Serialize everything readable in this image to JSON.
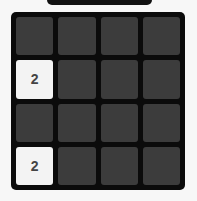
{
  "board": {
    "rows": 4,
    "cols": 4,
    "tiles": [
      [
        "",
        "",
        "",
        ""
      ],
      [
        "2",
        "",
        "",
        ""
      ],
      [
        "",
        "",
        "",
        ""
      ],
      [
        "2",
        "",
        "",
        ""
      ]
    ]
  },
  "colors": {
    "board": "#0b0b0b",
    "empty_tile": "#3c3c3c",
    "tile_2": "#f3f3f3",
    "tile_text": "#444444"
  }
}
